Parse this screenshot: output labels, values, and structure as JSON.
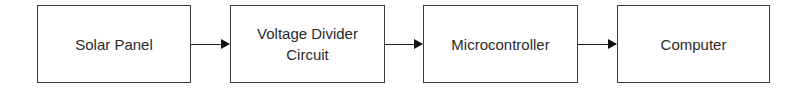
{
  "diagram": {
    "type": "block-diagram-flow",
    "blocks": [
      {
        "label": "Solar Panel"
      },
      {
        "label": "Voltage Divider\nCircuit",
        "line1": "Voltage Divider",
        "line2": "Circuit"
      },
      {
        "label": "Microcontroller"
      },
      {
        "label": "Computer"
      }
    ],
    "connections": [
      {
        "from": "Solar Panel",
        "to": "Voltage Divider Circuit"
      },
      {
        "from": "Voltage Divider Circuit",
        "to": "Microcontroller"
      },
      {
        "from": "Microcontroller",
        "to": "Computer"
      }
    ],
    "colors": {
      "stroke": "#3a3a3a",
      "text": "#2a2a2a",
      "background": "#ffffff"
    }
  }
}
